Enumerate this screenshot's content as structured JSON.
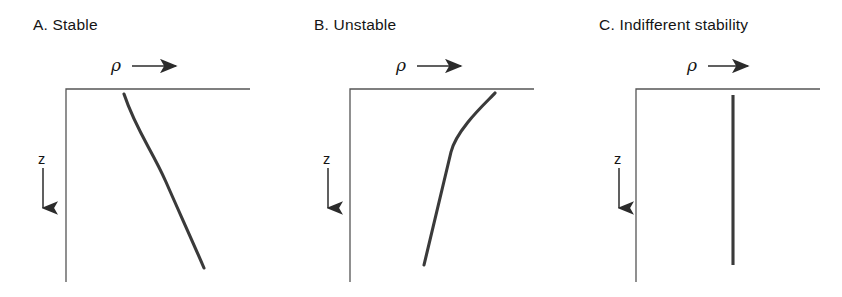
{
  "figure": {
    "background_color": "#ffffff",
    "ink_color": "#3a3a3a",
    "axis_color": "#555555",
    "text_color": "#141414"
  },
  "panels": [
    {
      "id": "panel-a",
      "title": "A.  Stable",
      "letter": "A.",
      "name": "Stable",
      "x_axis_label": "ρ",
      "x_axis_arrow": "right-arrow",
      "y_axis_label": "z",
      "y_axis_arrow": "down-arrow",
      "curve_type": "s-curve-bending-right",
      "curve_description": "Density increases with depth, steeply near surface, flattening in mid-depth, then steepening again toward bottom",
      "curve_path": "M 124,94 C 136,130 152,150 166,182 C 180,214 192,240 204,268"
    },
    {
      "id": "panel-b",
      "title": "B.  Unstable",
      "letter": "B.",
      "name": "Unstable",
      "x_axis_label": "ρ",
      "x_axis_arrow": "right-arrow",
      "y_axis_label": "z",
      "y_axis_arrow": "down-arrow",
      "curve_type": "straight-diagonal",
      "curve_description": "Density decreases with depth along a nearly straight line tilted to the right",
      "curve_path": "M 143,265 C 152,228 161,190 170,152 C 176,128 208,100 214,93"
    },
    {
      "id": "panel-c",
      "title": "C.  Indifferent stability",
      "letter": "C.",
      "name": "Indifferent stability",
      "x_axis_label": "ρ",
      "x_axis_arrow": "right-arrow",
      "y_axis_label": "z",
      "y_axis_arrow": "down-arrow",
      "curve_type": "vertical-line",
      "curve_description": "Density constant with depth, shown as a vertical line",
      "curve_path": "M 172,95 L 172,265"
    }
  ],
  "chart_data": {
    "type": "line",
    "xlabel": "ρ",
    "ylabel": "z",
    "axis_directions": {
      "x": "increasing to the right",
      "y": "increasing downward"
    },
    "grid": false,
    "legend": false,
    "series": [
      {
        "name": "A. Stable",
        "x": [
          0.3,
          0.38,
          0.47,
          0.56,
          0.66,
          0.78
        ],
        "z": [
          0.0,
          0.22,
          0.42,
          0.58,
          0.78,
          1.0
        ]
      },
      {
        "name": "B. Unstable",
        "x": [
          0.78,
          0.66,
          0.56,
          0.47,
          0.38,
          0.3
        ],
        "z": [
          0.0,
          0.3,
          0.5,
          0.68,
          0.85,
          1.0
        ]
      },
      {
        "name": "C. Indifferent stability",
        "x": [
          0.52,
          0.52,
          0.52,
          0.52,
          0.52,
          0.52
        ],
        "z": [
          0.0,
          0.2,
          0.4,
          0.6,
          0.8,
          1.0
        ]
      }
    ]
  }
}
